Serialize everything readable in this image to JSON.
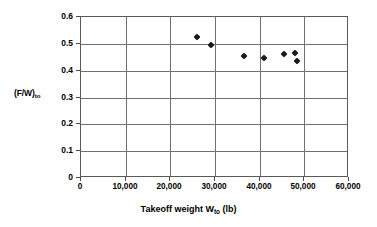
{
  "chart_data": {
    "type": "scatter",
    "title": "",
    "xlabel": "Takeoff weight W",
    "xlabel_sub": "to",
    "xlabel_unit": " (lb)",
    "ylabel": "(F/W)",
    "ylabel_sub": "to",
    "xlim": [
      0,
      60000
    ],
    "ylim": [
      0,
      0.6
    ],
    "grid": true,
    "legend": "none",
    "xticks": [
      0,
      10000,
      20000,
      30000,
      40000,
      50000,
      60000
    ],
    "xtick_labels": [
      "0",
      "10,000",
      "20,000",
      "30,000",
      "40,000",
      "50,000",
      "60,000"
    ],
    "yticks": [
      0,
      0.1,
      0.2,
      0.3,
      0.4,
      0.5,
      0.6
    ],
    "ytick_labels": [
      "0",
      "0.1",
      "0.2",
      "0.3",
      "0.4",
      "0.5",
      "0.6"
    ],
    "marker": "diamond",
    "marker_color": "#1a1a1a",
    "points": [
      {
        "x": 26000,
        "y": 0.525
      },
      {
        "x": 29000,
        "y": 0.497
      },
      {
        "x": 36500,
        "y": 0.454
      },
      {
        "x": 41000,
        "y": 0.449
      },
      {
        "x": 45500,
        "y": 0.461
      },
      {
        "x": 48000,
        "y": 0.464
      },
      {
        "x": 48300,
        "y": 0.436
      }
    ]
  },
  "axes": {
    "x_title_full": "Takeoff weight Wto (lb)",
    "y_title_full": "(F/W)to"
  }
}
